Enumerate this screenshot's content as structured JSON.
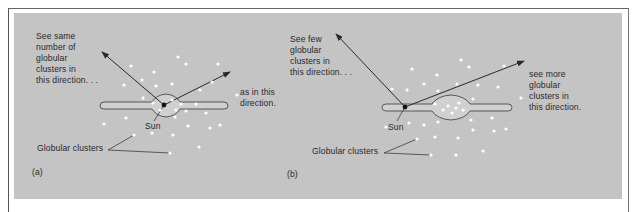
{
  "figure": {
    "panel_a": {
      "letter": "(a)",
      "upper_left_text": "See same\nnumber of\nglobular\nclusters in\nthis direction. . .",
      "right_text": "as in this\ndirection.",
      "sun_label": "Sun",
      "clusters_label": "Globular clusters"
    },
    "panel_b": {
      "letter": "(b)",
      "upper_left_text": "See few\nglobular\nclusters in\nthis direction. . .",
      "right_text": "see more\nglobular\nclusters in\nthis direction.",
      "sun_label": "Sun",
      "clusters_label": "Globular clusters"
    },
    "colors": {
      "background": "#c4c4c4",
      "cluster_dot": "#ffffff",
      "line": "#2a2a2a",
      "sun": "#111111"
    }
  }
}
